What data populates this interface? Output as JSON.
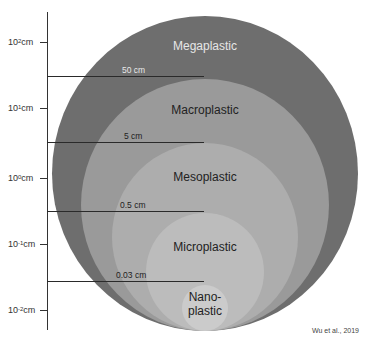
{
  "diagram": {
    "axis": {
      "ticks": [
        {
          "base": "10",
          "exp": "2",
          "unit": "cm",
          "y": 42
        },
        {
          "base": "10",
          "exp": "1",
          "unit": "cm",
          "y": 108
        },
        {
          "base": "10",
          "exp": "0",
          "unit": "cm",
          "y": 178
        },
        {
          "base": "10",
          "exp": "-1",
          "unit": "cm",
          "y": 244
        },
        {
          "base": "10",
          "exp": "-2",
          "unit": "cm",
          "y": 310
        }
      ]
    },
    "thresholds": [
      {
        "label": "50 cm",
        "y": 76,
        "color": "#e8e8e8"
      },
      {
        "label": "5 cm",
        "y": 142,
        "color": "#222222"
      },
      {
        "label": "0.5 cm",
        "y": 211,
        "color": "#222222"
      },
      {
        "label": "0.03 cm",
        "y": 281,
        "color": "#222222"
      }
    ],
    "categories": [
      {
        "name": "Megaplastic",
        "color": "#6e6e6e",
        "text_color": "#e6e6e6",
        "top": 16
      },
      {
        "name": "Macroplastic",
        "color": "#9a9a9a",
        "text_color": "#222222",
        "top": 79
      },
      {
        "name": "Mesoplastic",
        "color": "#adadad",
        "text_color": "#222222",
        "top": 143
      },
      {
        "name": "Microplastic",
        "color": "#bcbcbc",
        "text_color": "#222222",
        "top": 213
      },
      {
        "name_line1": "Nano-",
        "name_line2": "plastic",
        "color": "#cbcbcb",
        "text_color": "#222222",
        "top": 285
      }
    ],
    "credit": "Wu et al., 2019"
  }
}
